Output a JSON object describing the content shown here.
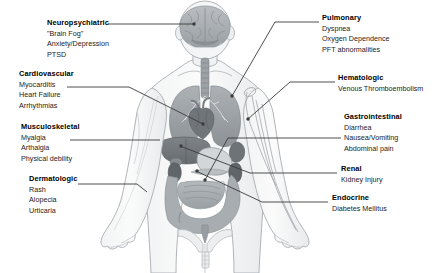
{
  "figure": {
    "background_color": "#ffffff",
    "line_color": "#3a3a3a",
    "body_outline_color": "#9aa0a6",
    "organ_fill_dark": "#7e8488",
    "organ_fill_mid": "#9ba1a5",
    "organ_fill_light": "#c8ccce"
  },
  "labels_left": [
    {
      "id": "neuropsychiatric",
      "title": "Neuropsychiatric",
      "items": [
        "\"Brain Fog\"",
        "Anxiety/Depression",
        "PTSD"
      ]
    },
    {
      "id": "cardiovascular",
      "title": "Cardiovascular",
      "items": [
        "Myocarditis",
        "Heart Failure",
        "Arrhythmias"
      ]
    },
    {
      "id": "musculoskeletal",
      "title": "Musculoskeletal",
      "items": [
        "Myalgia",
        "Arthalgia",
        "Physical debility"
      ]
    },
    {
      "id": "dermatologic",
      "title": "Dermatologic",
      "items": [
        "Rash",
        "Alopecia",
        "Urticaria"
      ]
    }
  ],
  "labels_right": [
    {
      "id": "pulmonary",
      "title": "Pulmonary",
      "items": [
        "Dyspnea",
        "Oxygen Dependence",
        "PFT abnormalities"
      ]
    },
    {
      "id": "hematologic",
      "title": "Hematologic",
      "items": [
        "Venous Thromboembolism"
      ]
    },
    {
      "id": "gastrointestinal",
      "title": "Gastrointestinal",
      "items": [
        "Diarrhea",
        "Nausea/Vomiting",
        "Abdominal pain"
      ]
    },
    {
      "id": "renal",
      "title": "Renal",
      "items": [
        "Kidney Injury"
      ]
    },
    {
      "id": "endocrine",
      "title": "Endocrine",
      "items": [
        "Diabetes Mellitus"
      ]
    }
  ]
}
